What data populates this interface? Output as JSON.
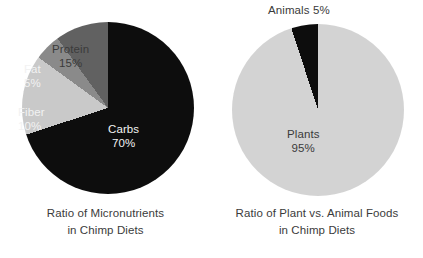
{
  "chart_data": [
    {
      "type": "pie",
      "title": "Ratio of Micronutrients in Chimp Diets",
      "title_line1": "Ratio of Micronutrients",
      "title_line2": "in Chimp Diets",
      "categories": [
        "Carbs",
        "Protein",
        "Fat",
        "Fiber"
      ],
      "values": [
        70,
        15,
        5,
        10
      ],
      "unit": "%",
      "labels": [
        {
          "name": "Carbs",
          "pct": "70%",
          "color": "#0d0d0d",
          "text_color": "#f2f2f2"
        },
        {
          "name": "Protein",
          "pct": "15%",
          "color": "#c9c9c9",
          "text_color": "#3b3b3b"
        },
        {
          "name": "Fat",
          "pct": "5%",
          "color": "#8a8a8a",
          "text_color": "#f2f2f2"
        },
        {
          "name": "Fiber",
          "pct": "10%",
          "color": "#616161",
          "text_color": "#f2f2f2"
        }
      ],
      "start_angle_deg": 0,
      "direction": "clockwise",
      "legend": "none",
      "grid": false
    },
    {
      "type": "pie",
      "title": "Ratio of Plant vs. Animal Foods in Chimp Diets",
      "title_line1": "Ratio of Plant vs. Animal Foods",
      "title_line2": "in Chimp Diets",
      "categories": [
        "Plants",
        "Animals"
      ],
      "values": [
        95,
        5
      ],
      "unit": "%",
      "labels": [
        {
          "name": "Plants",
          "pct": "95%",
          "color": "#d3d3d3",
          "text_color": "#3b3b3b"
        },
        {
          "name": "Animals",
          "pct": "5%",
          "color": "#0d0d0d",
          "text_color": "#3b3b3b"
        }
      ],
      "start_angle_deg": 0,
      "direction": "clockwise",
      "legend": "none",
      "grid": false
    }
  ],
  "left_chart": {
    "caption_line1": "Ratio of Micronutrients",
    "caption_line2": "in Chimp Diets",
    "slices": {
      "carbs": {
        "name": "Carbs",
        "pct": "70%"
      },
      "protein": {
        "name": "Protein",
        "pct": "15%"
      },
      "fat": {
        "name": "Fat",
        "pct": "5%"
      },
      "fiber": {
        "name": "Fiber",
        "pct": "10%"
      }
    }
  },
  "right_chart": {
    "caption_line1": "Ratio of Plant vs. Animal Foods",
    "caption_line2": "in Chimp Diets",
    "slices": {
      "animals": {
        "label": "Animals 5%"
      },
      "plants": {
        "name": "Plants",
        "pct": "95%"
      }
    }
  },
  "colors": {
    "background": "#ffffff",
    "text": "#3b3b3b",
    "dark": "#0d0d0d",
    "light_gray": "#c9c9c9",
    "mid_gray": "#8a8a8a",
    "dark_gray": "#616161",
    "plants_gray": "#d3d3d3"
  }
}
